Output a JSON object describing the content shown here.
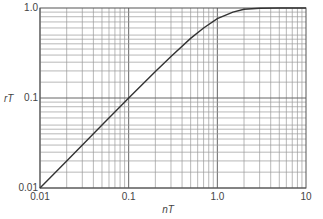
{
  "chart_data": {
    "type": "line",
    "title": "",
    "xlabel": "nT",
    "ylabel": "rT",
    "xscale": "log",
    "yscale": "log",
    "xlim": [
      0.01,
      10
    ],
    "ylim": [
      0.01,
      1.0
    ],
    "grid": true,
    "legend": "none",
    "x_tick_labels": [
      "0.01",
      "0.1",
      "1.0",
      "10"
    ],
    "y_tick_labels": [
      "0.01",
      "0.1",
      "1.0"
    ],
    "series": [
      {
        "name": "rT vs nT",
        "x": [
          0.01,
          0.02,
          0.05,
          0.1,
          0.2,
          0.3,
          0.5,
          0.7,
          1.0,
          1.5,
          2.0,
          3.0,
          5.0,
          10.0
        ],
        "y": [
          0.01,
          0.02,
          0.05,
          0.1,
          0.197,
          0.29,
          0.46,
          0.6,
          0.76,
          0.9,
          0.97,
          0.995,
          1.0,
          1.0
        ]
      }
    ]
  }
}
